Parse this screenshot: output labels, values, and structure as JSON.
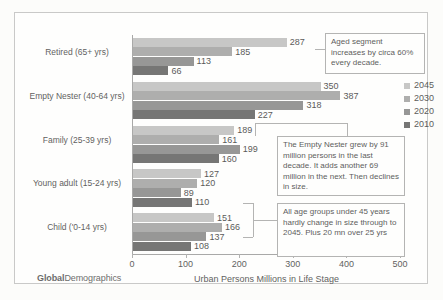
{
  "chart_data": {
    "type": "bar",
    "orientation": "horizontal",
    "title": "",
    "xlabel": "Urban Persons Millions in Life Stage",
    "ylabel": "",
    "xlim": [
      0,
      500
    ],
    "xticks": [
      0,
      100,
      200,
      300,
      400,
      500
    ],
    "grid": false,
    "legend_position": "right",
    "categories": [
      "Retired (65+ yrs)",
      "Empty Nester (40-64 yrs)",
      "Family (25-39 yrs)",
      "Young adult (15-24 yrs)",
      "Child ('0-14 yrs)"
    ],
    "series": [
      {
        "name": "2045",
        "color": "#b6b6b6",
        "values": [
          287,
          350,
          189,
          127,
          151
        ]
      },
      {
        "name": "2030",
        "color": "#949494",
        "values": [
          185,
          387,
          161,
          120,
          166
        ]
      },
      {
        "name": "2020",
        "color": "#767676",
        "values": [
          113,
          318,
          199,
          89,
          137
        ]
      },
      {
        "name": "2010",
        "color": "#4a4a4a",
        "values": [
          66,
          227,
          160,
          110,
          108
        ]
      }
    ]
  },
  "legend": {
    "items": [
      {
        "label": "2045",
        "color": "#b6b6b6"
      },
      {
        "label": "2030",
        "color": "#949494"
      },
      {
        "label": "2020",
        "color": "#767676"
      },
      {
        "label": "2010",
        "color": "#4a4a4a"
      }
    ]
  },
  "callouts": {
    "aged": "Aged segment increases by  circa 60% every decade.",
    "nester": "The Empty Nester grew by 91 million persons in the last decade. It adds another 69 million in the next. Then declines in size.",
    "young": "All age groups under 45 years hardly change in size through to 2045. Plus 20 mn over 25 yrs"
  },
  "footer": {
    "brand_bold": "Global",
    "brand_light": "Demographics"
  }
}
